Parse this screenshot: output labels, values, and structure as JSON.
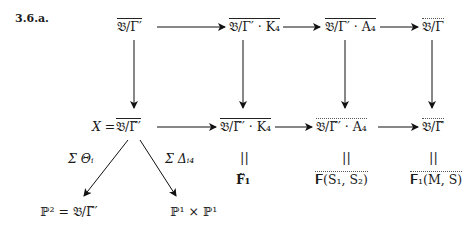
{
  "tag": "3.6.a.",
  "top_row": [
    {
      "id": "t1",
      "text": "𝔅/Γ′"
    },
    {
      "id": "t2",
      "text": "𝔅/Γ′ · K₄"
    },
    {
      "id": "t3",
      "text": "𝔅/Γ′ · A₄"
    },
    {
      "id": "t4",
      "text": "𝔅/Γ"
    }
  ],
  "middle_row": [
    {
      "id": "m1_prefix",
      "text": "X ="
    },
    {
      "id": "m1",
      "text": "𝔅/Γ̃′"
    },
    {
      "id": "m2",
      "text": "𝔅/Γ̃′ · K₄"
    },
    {
      "id": "m3",
      "text": "𝔅/Γ̃′ · A₄"
    },
    {
      "id": "m4",
      "text": "𝔅/Γ̃"
    }
  ],
  "equals_sign": "||",
  "bottom_row": [
    {
      "id": "b2",
      "text": "𝐅̃₁"
    },
    {
      "id": "b3",
      "text": "𝐅(S₁, S₂)"
    },
    {
      "id": "b4",
      "text": "𝐅₁(M, S)"
    }
  ],
  "diagonal_labels": {
    "left": "Σ Θᵢ",
    "right": "Σ Δᵢ₄"
  },
  "diagonal_targets": {
    "left": "ℙ² = 𝔅/Γ̃′",
    "right": "ℙ¹ × ℙ¹"
  }
}
